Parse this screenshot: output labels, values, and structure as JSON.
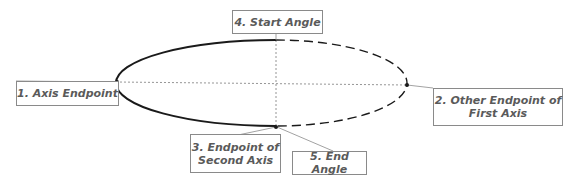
{
  "diagram": {
    "type": "ellipse-arc-construction",
    "colors": {
      "curve": "#1a1a1a",
      "axis_dotted": "#7a7a7a",
      "leader_line": "#8a8a8a",
      "label_text": "#5a5a5a",
      "label_border": "#8a8a8a"
    },
    "labels": [
      {
        "id": "axis-endpoint",
        "lines": [
          "1. Axis Endpoint"
        ]
      },
      {
        "id": "other-endpoint-first-axis",
        "lines": [
          "2. Other Endpoint of",
          "First Axis"
        ]
      },
      {
        "id": "endpoint-second-axis",
        "lines": [
          "3. Endpoint of",
          "Second Axis"
        ]
      },
      {
        "id": "start-angle",
        "lines": [
          "4. Start Angle"
        ]
      },
      {
        "id": "end-angle",
        "lines": [
          "5. End Angle"
        ]
      }
    ]
  }
}
